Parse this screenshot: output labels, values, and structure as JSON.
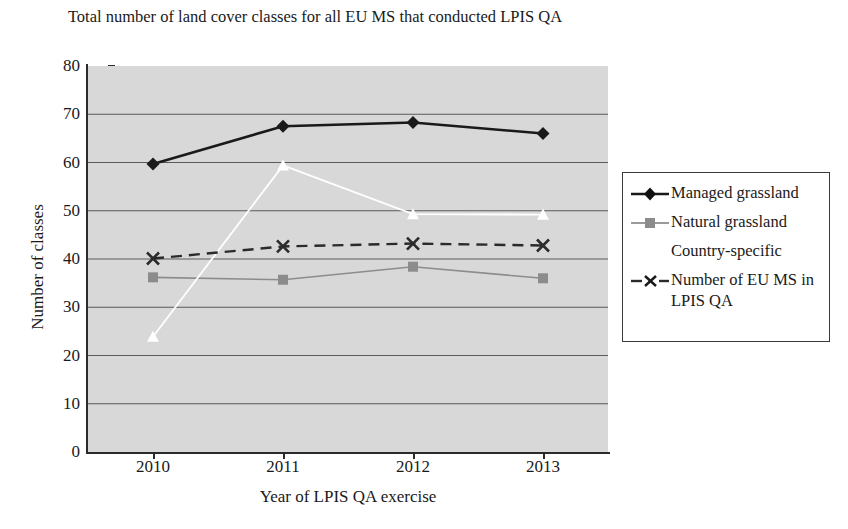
{
  "chart_data": {
    "type": "line",
    "title": "Total number of land cover classes for all EU MS that conducted LPIS QA",
    "xlabel": "Year of LPIS QA exercise",
    "ylabel": "Number of classes",
    "categories": [
      "2010",
      "2011",
      "2012",
      "2013"
    ],
    "x": [
      2010,
      2011,
      2012,
      2013
    ],
    "ylim": [
      0,
      80
    ],
    "yticks": [
      0,
      10,
      20,
      30,
      40,
      50,
      60,
      70,
      80
    ],
    "grid": true,
    "legend_position": "right",
    "plot_background": "#d8d8d8",
    "series": [
      {
        "name": "Managed grassland",
        "values": [
          59.7,
          67.5,
          68.3,
          66.0
        ],
        "color": "#1a1a1a",
        "marker": "diamond",
        "line_style": "solid",
        "line_width": 2.6
      },
      {
        "name": "Natural grassland",
        "values": [
          36.2,
          35.7,
          38.4,
          36.0
        ],
        "color": "#8c8c8c",
        "marker": "square",
        "line_style": "solid",
        "line_width": 1.6
      },
      {
        "name": "Country-specific",
        "values": [
          23.9,
          59.4,
          49.3,
          49.2
        ],
        "color": "#ffffff",
        "marker": "triangle",
        "line_style": "solid",
        "line_width": 1.8
      },
      {
        "name": "Number of EU MS in LPIS QA",
        "values": [
          40.1,
          42.6,
          43.2,
          42.8
        ],
        "color": "#2b2b2b",
        "marker": "x",
        "line_style": "dashed",
        "line_width": 2.4
      }
    ]
  },
  "legend": {
    "items": [
      {
        "label": "Managed grassland"
      },
      {
        "label": "Natural grassland"
      },
      {
        "label": "Country-specific"
      },
      {
        "label": "Number of EU MS in LPIS QA"
      }
    ]
  }
}
